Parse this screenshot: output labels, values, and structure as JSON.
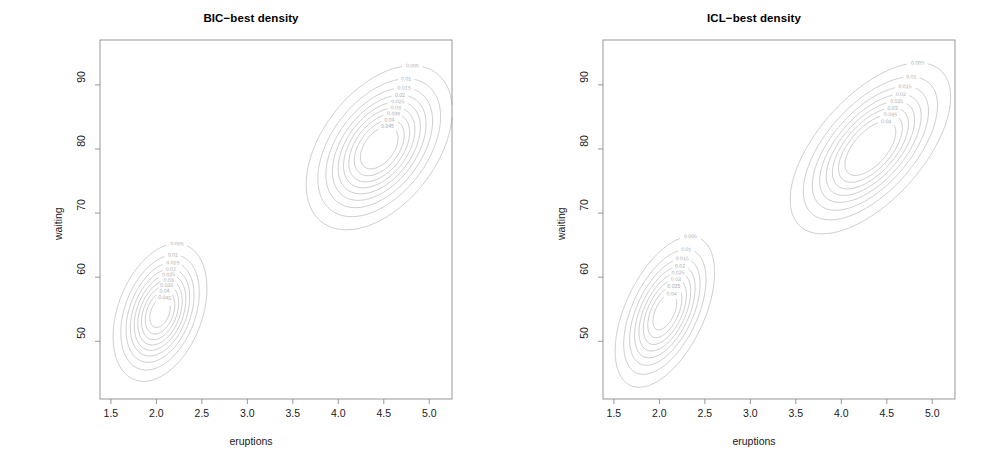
{
  "figure": {
    "width": 1005,
    "height": 476,
    "background": "#ffffff",
    "contour_color": "#b9b9b9",
    "axis_color": "#8c8c8c",
    "label_color": "#adadad",
    "text_color": "#1a1a1a"
  },
  "panels": [
    {
      "id": "bic",
      "title": "BIC−best density",
      "xlabel": "eruptions",
      "ylabel": "waiting"
    },
    {
      "id": "icl",
      "title": "ICL−best density",
      "xlabel": "eruptions",
      "ylabel": "waiting"
    }
  ],
  "axes": {
    "x_ticks": [
      "1.5",
      "2.0",
      "2.5",
      "3.0",
      "3.5",
      "4.0",
      "4.5",
      "5.0"
    ],
    "y_ticks": [
      "50",
      "60",
      "70",
      "80",
      "90"
    ],
    "xlim": [
      1.38,
      5.25
    ],
    "ylim": [
      41.0,
      97.0
    ]
  },
  "chart_data": {
    "type": "contour",
    "xlabel": "eruptions",
    "ylabel": "waiting",
    "xlim": [
      1.38,
      5.25
    ],
    "ylim": [
      41.0,
      97.0
    ],
    "xticks": [
      1.5,
      2.0,
      2.5,
      3.0,
      3.5,
      4.0,
      4.5,
      5.0
    ],
    "yticks": [
      50,
      60,
      70,
      80,
      90
    ],
    "grid": false,
    "legend": "none",
    "dataset": "Old Faithful geyser (eruptions vs waiting)",
    "panels": [
      {
        "name": "BIC-best density",
        "contour_levels": [
          0.005,
          0.01,
          0.015,
          0.02,
          0.025,
          0.03,
          0.035,
          0.04,
          0.045
        ],
        "labeled_levels_upper_cluster": [
          "0.02",
          "0.03",
          "0.04",
          "0.045",
          "0.035",
          "0.030",
          "0.015",
          "0.01",
          "0.005"
        ],
        "labeled_levels_lower_cluster": [
          "0.005",
          "0.01",
          "0.02",
          "0.04",
          "0.07",
          "0.025",
          "0.015"
        ],
        "components": [
          {
            "name": "short-eruption cluster",
            "mean_x": 2.04,
            "mean_y": 54.5,
            "sd_x": 0.24,
            "sd_y": 5.0,
            "correlation": 0.35,
            "weight": 0.355
          },
          {
            "name": "long-eruption cluster",
            "mean_x": 4.45,
            "mean_y": 80.2,
            "sd_x": 0.37,
            "sd_y": 5.9,
            "correlation": 0.45,
            "weight": 0.645
          }
        ]
      },
      {
        "name": "ICL-best density",
        "contour_levels": [
          0.005,
          0.01,
          0.015,
          0.02,
          0.025,
          0.03,
          0.035,
          0.04
        ],
        "labeled_levels_upper_cluster": [
          "0.005",
          "0.015",
          "0.025",
          "0.035",
          "0.04",
          "0.03",
          "0.02",
          "0.01"
        ],
        "labeled_levels_lower_cluster": [
          "0.005",
          "0.015",
          "0.025",
          "0.04",
          "0.035",
          "0.03",
          "0.02",
          "0.01"
        ],
        "components": [
          {
            "name": "short-eruption cluster",
            "mean_x": 2.06,
            "mean_y": 54.6,
            "sd_x": 0.26,
            "sd_y": 5.6,
            "correlation": 0.52,
            "weight": 0.355
          },
          {
            "name": "long-eruption cluster",
            "mean_x": 4.32,
            "mean_y": 80.1,
            "sd_x": 0.41,
            "sd_y": 6.2,
            "correlation": 0.6,
            "weight": 0.645
          }
        ]
      }
    ]
  }
}
